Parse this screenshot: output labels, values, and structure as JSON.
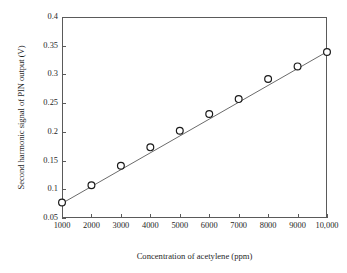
{
  "chart_data": {
    "type": "scatter",
    "title": "",
    "xlabel": "Concentration of acetylene (ppm)",
    "ylabel": "Second harmonic signal of PIN output (V)",
    "xlim": [
      1000,
      10000
    ],
    "ylim": [
      0.05,
      0.4
    ],
    "grid": false,
    "legend": null,
    "xticks": [
      1000,
      2000,
      3000,
      4000,
      5000,
      6000,
      7000,
      8000,
      9000,
      10000
    ],
    "xticklabels": [
      "1000",
      "2000",
      "3000",
      "4000",
      "5000",
      "6000",
      "7000",
      "8000",
      "9000",
      "10,000"
    ],
    "yticks": [
      0.05,
      0.1,
      0.15,
      0.2,
      0.25,
      0.3,
      0.35,
      0.4
    ],
    "yticklabels": [
      "0.05",
      "0.1",
      "0.15",
      "0.2",
      "0.25",
      "0.3",
      "0.35",
      "0.4"
    ],
    "x": [
      1000,
      2000,
      3000,
      4000,
      5000,
      6000,
      7000,
      8000,
      9000,
      10000
    ],
    "values": [
      0.077,
      0.107,
      0.141,
      0.173,
      0.202,
      0.231,
      0.257,
      0.292,
      0.314,
      0.339
    ],
    "series": [
      {
        "name": "Second harmonic signal",
        "marker": "open-circle",
        "marker_color": "#1a1a1a",
        "values": [
          0.077,
          0.107,
          0.141,
          0.173,
          0.202,
          0.231,
          0.257,
          0.292,
          0.314,
          0.339
        ]
      }
    ],
    "fit_line": {
      "name": "linear fit",
      "color": "#6b6b6b",
      "x": [
        1000,
        10000
      ],
      "y": [
        0.0755,
        0.3395
      ]
    },
    "colors": {
      "axis": "#5a5a5a",
      "text": "#1f1f1f",
      "line": "#6b6b6b",
      "marker_edge": "#1a1a1a",
      "marker_fill": "#ffffff",
      "background": "#ffffff"
    }
  }
}
